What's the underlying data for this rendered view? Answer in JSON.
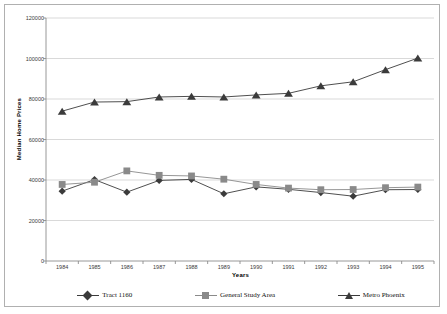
{
  "chart_data": {
    "type": "line",
    "title": "",
    "xlabel": "Years",
    "ylabel": "Median Home Prices",
    "categories": [
      "1984",
      "1985",
      "1986",
      "1987",
      "1988",
      "1989",
      "1990",
      "1991",
      "1992",
      "1993",
      "1994",
      "1995"
    ],
    "ylim": [
      0,
      120000
    ],
    "ytick_labels": [
      "0",
      "20000",
      "40000",
      "60000",
      "80000",
      "100000",
      "120000"
    ],
    "ytick_values": [
      0,
      20000,
      40000,
      60000,
      80000,
      100000,
      120000
    ],
    "grid": "horizontal",
    "legend_position": "bottom",
    "series": [
      {
        "name": "Tract 1160",
        "marker": "diamond",
        "color": "#3b3b3b",
        "values": [
          34500,
          40200,
          34000,
          39800,
          40300,
          33200,
          36600,
          35400,
          33800,
          32000,
          35200,
          35300
        ]
      },
      {
        "name": "General Study Area",
        "marker": "square",
        "color": "#8a8a8a",
        "values": [
          37800,
          38900,
          44500,
          42300,
          42000,
          40400,
          37800,
          36000,
          35200,
          35300,
          36200,
          36500
        ]
      },
      {
        "name": "Metro Phoenix",
        "marker": "triangle",
        "color": "#3b3b3b",
        "values": [
          74000,
          78500,
          78700,
          81000,
          81300,
          81000,
          82000,
          82800,
          86500,
          88500,
          94500,
          100200
        ]
      }
    ]
  },
  "legend": {
    "items": [
      {
        "label": "Tract 1160",
        "marker": "diamond-marker"
      },
      {
        "label": "General Study Area",
        "marker": "square-marker"
      },
      {
        "label": "Metro Phoenix",
        "marker": "triangle-marker"
      }
    ]
  },
  "axes": {
    "y_title": "Median Home Prices",
    "x_title": "Years"
  },
  "colors": {
    "series_dark": "#3b3b3b",
    "series_gray": "#8a8a8a",
    "grid": "#c8c8c8",
    "axis": "#8c8c8c",
    "frame": "#b0b0b0",
    "text": "#3a3a3a"
  }
}
